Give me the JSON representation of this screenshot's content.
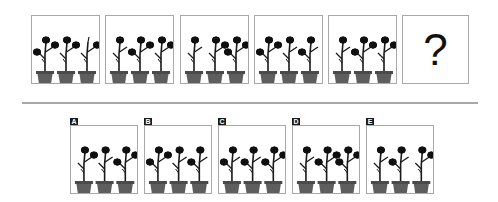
{
  "puzzle": {
    "question_mark": "?",
    "sequence": [
      {
        "plants": [
          [
            1,
            1,
            1
          ],
          [
            0,
            1,
            1
          ],
          [
            0,
            0,
            1
          ]
        ]
      },
      {
        "plants": [
          [
            0,
            1,
            0
          ],
          [
            1,
            1,
            1
          ],
          [
            0,
            1,
            1
          ]
        ]
      },
      {
        "plants": [
          [
            0,
            1,
            0
          ],
          [
            0,
            1,
            1
          ],
          [
            1,
            1,
            1
          ]
        ]
      },
      {
        "plants": [
          [
            1,
            1,
            1
          ],
          [
            0,
            1,
            0
          ],
          [
            1,
            1,
            0
          ]
        ]
      },
      {
        "plants": [
          [
            0,
            1,
            0
          ],
          [
            1,
            1,
            1
          ],
          [
            0,
            1,
            1
          ]
        ]
      }
    ],
    "options": [
      {
        "label": "A",
        "plants": [
          [
            0,
            1,
            1
          ],
          [
            0,
            1,
            0
          ],
          [
            1,
            1,
            1
          ]
        ]
      },
      {
        "label": "B",
        "plants": [
          [
            1,
            1,
            1
          ],
          [
            0,
            1,
            0
          ],
          [
            1,
            1,
            0
          ]
        ]
      },
      {
        "label": "C",
        "plants": [
          [
            1,
            1,
            0
          ],
          [
            1,
            1,
            0
          ],
          [
            1,
            1,
            1
          ]
        ]
      },
      {
        "label": "D",
        "plants": [
          [
            0,
            1,
            0
          ],
          [
            1,
            1,
            1
          ],
          [
            1,
            1,
            1
          ]
        ]
      },
      {
        "label": "E",
        "plants": [
          [
            0,
            1,
            0
          ],
          [
            1,
            1,
            0
          ],
          [
            0,
            1,
            1
          ]
        ]
      }
    ]
  },
  "colors": {
    "pot": "#5e5e5e",
    "pot_rim": "#4a4a4a",
    "stem": "#1a1a1a",
    "flower": "#111111",
    "border": "#a8a8a8",
    "badge": "#1a1a1a"
  }
}
